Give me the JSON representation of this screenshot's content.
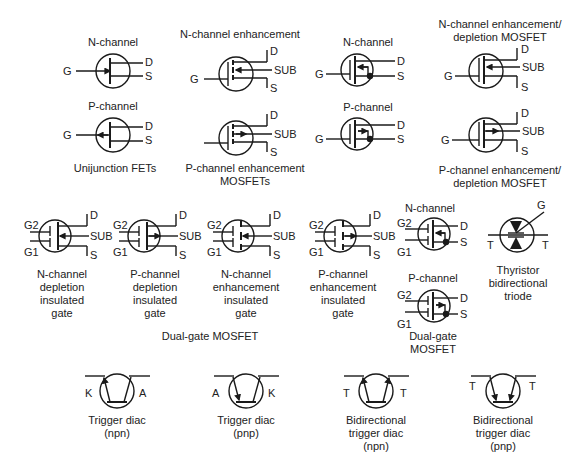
{
  "diagram": {
    "type": "electronic-schematic-symbol-reference",
    "groups": {
      "unijunction": {
        "caption": "Unijunction FETs",
        "items": [
          {
            "label": "N-channel",
            "pins": [
              "G",
              "D",
              "S"
            ]
          },
          {
            "label": "P-channel",
            "pins": [
              "G",
              "D",
              "S"
            ]
          }
        ]
      },
      "enh_mosfets": {
        "caption_line1": "P-channel enhancement",
        "caption_line2": "MOSFETs",
        "items": [
          {
            "label": "N-channel enhancement",
            "pins": [
              "G",
              "D",
              "SUB",
              "S"
            ]
          },
          {
            "label": "",
            "pins": [
              "D",
              "SUB",
              "S"
            ]
          }
        ]
      },
      "mosfet_small": {
        "items": [
          {
            "label": "N-channel",
            "pins": [
              "G",
              "D",
              "S"
            ]
          },
          {
            "label": "P-channel",
            "pins": [
              "G",
              "D",
              "S"
            ]
          }
        ]
      },
      "enh_dep": {
        "top_label_line1": "N-channel enhancement/",
        "top_label_line2": "depletion MOSFET",
        "bottom_label_line1": "P-channel enhancement/",
        "bottom_label_line2": "depletion MOSFET",
        "pins": [
          "G",
          "D",
          "SUB",
          "S"
        ]
      },
      "insulated_gate": {
        "items": [
          {
            "lines": [
              "N-channel",
              "depletion",
              "insulated",
              "gate"
            ],
            "pins": [
              "G2",
              "G1",
              "D",
              "SUB",
              "S"
            ]
          },
          {
            "lines": [
              "P-channel",
              "depletion",
              "insulated",
              "gate"
            ],
            "pins": [
              "G2",
              "G1",
              "D",
              "SUB",
              "S"
            ]
          },
          {
            "lines": [
              "N-channel",
              "enhancement",
              "insulated",
              "gate"
            ],
            "pins": [
              "G2",
              "G1",
              "D",
              "SUB",
              "S"
            ]
          },
          {
            "lines": [
              "P-channel",
              "enhancement",
              "insulated",
              "gate"
            ],
            "pins": [
              "G2",
              "G1",
              "D",
              "SUB",
              "S"
            ]
          }
        ],
        "group_caption": "Dual-gate MOSFET"
      },
      "dual_gate": {
        "top_label": "N-channel",
        "bottom_label": "P-channel",
        "caption_line1": "Dual-gate",
        "caption_line2": "MOSFET",
        "pins": [
          "G2",
          "G1",
          "D",
          "S"
        ]
      },
      "thyristor": {
        "lines": [
          "Thyristor",
          "bidirectional",
          "triode"
        ],
        "pins": [
          "G",
          "T",
          "T"
        ]
      },
      "diacs": [
        {
          "lines": [
            "Trigger diac",
            "(npn)"
          ],
          "left_pin": "K",
          "right_pin": "A"
        },
        {
          "lines": [
            "Trigger diac",
            "(pnp)"
          ],
          "left_pin": "A",
          "right_pin": "K"
        },
        {
          "lines": [
            "Bidirectional",
            "trigger diac",
            "(npn)"
          ],
          "left_pin": "T",
          "right_pin": "T"
        },
        {
          "lines": [
            "Bidirectional",
            "trigger diac",
            "(pnp)"
          ],
          "left_pin": "T",
          "right_pin": "T"
        }
      ]
    },
    "colors": {
      "ink": "#1a1a1a",
      "background": "#ffffff"
    }
  }
}
